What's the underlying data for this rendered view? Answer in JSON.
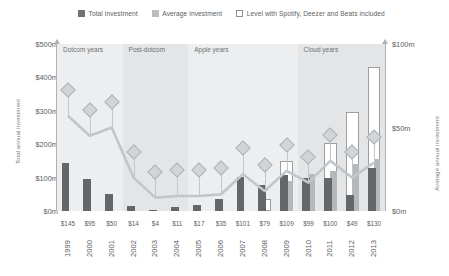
{
  "legend": {
    "items": [
      {
        "label": "Total investment",
        "swatch": "total-swatch",
        "color": "#63676a"
      },
      {
        "label": "Average investment",
        "swatch": "average-swatch",
        "color": "#b4b8ba"
      },
      {
        "label": "Level with Spotify, Deezer and Beats included",
        "swatch": "level-swatch",
        "color": "#ffffff"
      }
    ]
  },
  "axes": {
    "left_title": "Total annual investment",
    "right_title": "Average annual investment",
    "left_ticks": [
      "$500m",
      "$400m",
      "$300m",
      "$200m",
      "$100m",
      "$0m"
    ],
    "right_ticks": [
      "$100m",
      "$50m",
      "$0m"
    ]
  },
  "bands": [
    {
      "label": "Dotcom years"
    },
    {
      "label": "Post-dotcom"
    },
    {
      "label": "Apple years"
    },
    {
      "label": "Cloud years"
    }
  ],
  "chart_data": {
    "type": "bar",
    "title": "",
    "xlabel": "",
    "ylabel": "Total annual investment",
    "ylabel_right": "Average annual investment",
    "ylim": [
      0,
      500
    ],
    "ylim_right": [
      0,
      100
    ],
    "grid": false,
    "legend_position": "top",
    "categories": [
      "1999",
      "2000",
      "2001",
      "2002",
      "2003",
      "2004",
      "2005",
      "2006",
      "2007",
      "2008",
      "2009",
      "2010",
      "2011",
      "2012",
      "2013"
    ],
    "value_labels": [
      "$145",
      "$95",
      "$50",
      "$14",
      "$4",
      "$11",
      "$17",
      "$35",
      "$101",
      "$79",
      "$109",
      "$99",
      "$100",
      "$49",
      "$130"
    ],
    "series": [
      {
        "name": "Total investment",
        "color": "#63676a",
        "axis": "left",
        "values": [
          145,
          95,
          50,
          14,
          4,
          11,
          17,
          35,
          101,
          79,
          109,
          99,
          100,
          49,
          130
        ]
      },
      {
        "name": "Average investment",
        "color": "#b4b8ba",
        "axis": "right",
        "values": [
          0,
          0,
          0,
          0,
          0,
          0,
          0,
          0,
          0,
          0,
          18,
          22,
          24,
          28,
          31
        ]
      },
      {
        "name": "Level with Spotify, Deezer and Beats included",
        "color": "#ffffff",
        "axis": "left",
        "values": [
          0,
          0,
          0,
          0,
          0,
          0,
          0,
          0,
          0,
          36,
          150,
          0,
          205,
          295,
          430
        ]
      },
      {
        "name": "Average investment line",
        "color": "#c2c6c8",
        "axis": "right",
        "values": [
          57,
          45,
          50,
          20,
          8,
          9,
          9,
          10,
          22,
          12,
          24,
          17,
          30,
          20,
          29
        ]
      }
    ]
  }
}
